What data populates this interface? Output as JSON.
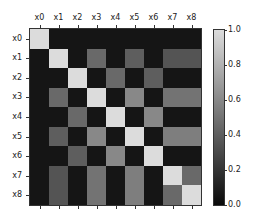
{
  "chart_data": {
    "type": "heatmap",
    "title": "",
    "xlabel": "",
    "ylabel": "",
    "x_tick_labels": [
      "x0",
      "x1",
      "x2",
      "x3",
      "x4",
      "x5",
      "x6",
      "x7",
      "x8"
    ],
    "y_tick_labels": [
      "x0",
      "x1",
      "x2",
      "x3",
      "x4",
      "x5",
      "x6",
      "x7",
      "x8"
    ],
    "x_tick_position": "top",
    "colormap": "gray",
    "vmin": 0.0,
    "vmax": 1.0,
    "colorbar": {
      "ticks": [
        0.0,
        0.2,
        0.4,
        0.6,
        0.8,
        1.0
      ],
      "tick_labels": [
        "0.0",
        "0.2",
        "0.4",
        "0.6",
        "0.8",
        "1.0"
      ]
    },
    "matrix": [
      [
        1.0,
        0.05,
        0.05,
        0.05,
        0.05,
        0.05,
        0.05,
        0.05,
        0.05
      ],
      [
        0.05,
        1.0,
        0.05,
        0.45,
        0.05,
        0.4,
        0.05,
        0.35,
        0.35
      ],
      [
        0.05,
        0.05,
        1.0,
        0.05,
        0.45,
        0.05,
        0.4,
        0.05,
        0.05
      ],
      [
        0.05,
        0.45,
        0.05,
        1.0,
        0.05,
        0.6,
        0.05,
        0.5,
        0.5
      ],
      [
        0.05,
        0.05,
        0.45,
        0.05,
        1.0,
        0.05,
        0.6,
        0.05,
        0.05
      ],
      [
        0.05,
        0.4,
        0.05,
        0.6,
        0.05,
        1.0,
        0.05,
        0.55,
        0.55
      ],
      [
        0.05,
        0.05,
        0.4,
        0.05,
        0.6,
        0.05,
        1.0,
        0.05,
        0.05
      ],
      [
        0.05,
        0.35,
        0.05,
        0.5,
        0.05,
        0.55,
        0.05,
        1.0,
        0.45
      ],
      [
        0.05,
        0.35,
        0.05,
        0.5,
        0.05,
        0.55,
        0.05,
        0.45,
        1.0
      ]
    ],
    "grid": false,
    "legend_position": "right (colorbar)"
  }
}
